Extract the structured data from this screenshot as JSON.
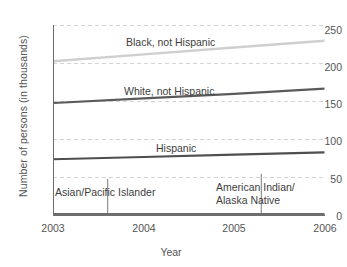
{
  "chart_data": {
    "type": "line",
    "title": "",
    "xlabel": "Year",
    "ylabel": "Number of persons (in thousands)",
    "x": [
      2003,
      2004,
      2005,
      2006
    ],
    "xlim": [
      2003,
      2006
    ],
    "ylim": [
      0,
      250
    ],
    "xticks": [
      "2003",
      "2004",
      "2005",
      "2006"
    ],
    "yticks": [
      "0",
      "50",
      "100",
      "150",
      "200",
      "250"
    ],
    "grid": true,
    "legend_position": "inline-annotations",
    "series": [
      {
        "name": "Black, not Hispanic",
        "color": "#cfcfcf",
        "values": [
          203,
          212,
          221,
          230
        ]
      },
      {
        "name": "White, not Hispanic",
        "color": "#5a5a5a",
        "values": [
          148,
          154,
          160,
          167
        ]
      },
      {
        "name": "Hispanic",
        "color": "#4f4f4f",
        "values": [
          74,
          77,
          80,
          83
        ]
      },
      {
        "name": "Asian/Pacific Islander",
        "color": "#6e6e6e",
        "values": [
          2,
          2,
          2,
          2
        ]
      },
      {
        "name": "American Indian/ Alaska Native",
        "color": "#6e6e6e",
        "values": [
          1,
          1,
          1,
          1
        ]
      }
    ],
    "annotations": [
      {
        "text": "Black, not Hispanic",
        "x": 2004.45,
        "y": 236
      },
      {
        "text": "White, not Hispanic",
        "x": 2004.45,
        "y": 180
      },
      {
        "text": "Hispanic",
        "x": 2004.45,
        "y": 101
      },
      {
        "text": "Asian/Pacific Islander",
        "x": 2003.6,
        "y": 40,
        "leader_to_x": 2003.6
      },
      {
        "text": "American Indian/",
        "x": 2005.3,
        "y": 47,
        "leader_to_x": 2005.3
      },
      {
        "text": "Alaska Native",
        "x": 2005.3,
        "y": 33
      }
    ]
  },
  "labels": {
    "y_axis_title": "Number of persons (in thousands)",
    "x_axis_title": "Year",
    "y_ticks": [
      "250",
      "200",
      "150",
      "100",
      "50",
      "0"
    ],
    "x_ticks": [
      "2003",
      "2004",
      "2005",
      "2006"
    ],
    "series_black": "Black, not Hispanic",
    "series_white": "White, not Hispanic",
    "series_hispanic": "Hispanic",
    "series_asian": "Asian/Pacific Islander",
    "series_amindian_line1": "American Indian/",
    "series_amindian_line2": "Alaska Native"
  }
}
